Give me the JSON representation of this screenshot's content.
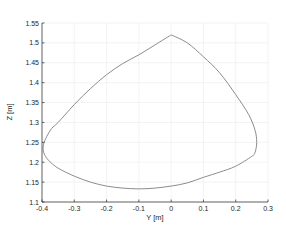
{
  "chart_data": {
    "type": "line",
    "title": "",
    "xlabel": "Y [m]",
    "ylabel": "Z [m]",
    "xlim": [
      -0.4,
      0.3
    ],
    "ylim": [
      1.1,
      1.55
    ],
    "grid": true,
    "xticks": [
      -0.4,
      -0.3,
      -0.2,
      -0.1,
      0,
      0.1,
      0.2,
      0.3
    ],
    "xtick_labels": [
      "-0.4",
      "-0.3",
      "-0.2",
      "-0.1",
      "0",
      "0.1",
      "0.2",
      "0.3"
    ],
    "yticks": [
      1.1,
      1.15,
      1.2,
      1.25,
      1.3,
      1.35,
      1.4,
      1.45,
      1.5,
      1.55
    ],
    "ytick_labels": [
      "1.1",
      "1.15",
      "1.2",
      "1.25",
      "1.3",
      "1.35",
      "1.4",
      "1.45",
      "1.5",
      "1.55"
    ],
    "series": [
      {
        "name": "trajectory",
        "color": "#7f7f7f",
        "closed": true,
        "x": [
          0,
          0.05,
          0.1,
          0.15,
          0.2,
          0.24,
          0.26,
          0.265,
          0.26,
          0.25,
          0.2,
          0.15,
          0.1,
          0.05,
          0,
          -0.05,
          -0.1,
          -0.15,
          -0.2,
          -0.25,
          -0.3,
          -0.35,
          -0.38,
          -0.395,
          -0.395,
          -0.385,
          -0.37,
          -0.35,
          -0.3,
          -0.25,
          -0.2,
          -0.15,
          -0.1,
          -0.05,
          0
        ],
        "y": [
          1.52,
          1.5,
          1.465,
          1.425,
          1.37,
          1.32,
          1.28,
          1.25,
          1.225,
          1.215,
          1.19,
          1.175,
          1.162,
          1.148,
          1.14,
          1.135,
          1.133,
          1.135,
          1.14,
          1.15,
          1.165,
          1.185,
          1.205,
          1.225,
          1.245,
          1.265,
          1.285,
          1.3,
          1.345,
          1.385,
          1.42,
          1.448,
          1.47,
          1.495,
          1.52
        ]
      }
    ]
  }
}
